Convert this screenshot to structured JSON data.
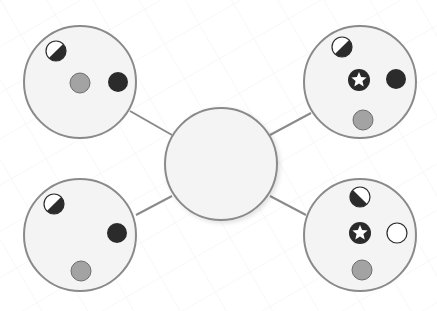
{
  "colors": {
    "background": "#ffffff",
    "grid": "#f1f1f1",
    "node_fill": "#f4f4f4",
    "node_stroke": "#8a8a8a",
    "connector": "#8a8a8a",
    "dark": "#2b2b2b",
    "gray_dot": "#a3a3a3",
    "gray_dot_stroke": "#6e6e6e",
    "white_dot": "#ffffff"
  },
  "center_node": {
    "cx": 221,
    "cy": 164,
    "r": 56
  },
  "nodes": [
    {
      "id": "top-left",
      "cx": 80,
      "cy": 82,
      "r": 56,
      "connector": {
        "x1": 130,
        "y1": 111,
        "x2": 172,
        "y2": 135
      },
      "items": [
        {
          "type": "half",
          "orientation": "dark-lower-right",
          "cx": 56,
          "cy": 51
        },
        {
          "type": "gray",
          "cx": 80,
          "cy": 83
        },
        {
          "type": "black",
          "cx": 118,
          "cy": 82
        }
      ]
    },
    {
      "id": "top-right",
      "cx": 360,
      "cy": 82,
      "r": 56,
      "connector": {
        "x1": 311,
        "y1": 113,
        "x2": 270,
        "y2": 135
      },
      "items": [
        {
          "type": "half",
          "orientation": "dark-lower-right",
          "cx": 342,
          "cy": 47
        },
        {
          "type": "star",
          "cx": 359,
          "cy": 80
        },
        {
          "type": "black",
          "cx": 396,
          "cy": 79
        },
        {
          "type": "gray",
          "cx": 363,
          "cy": 120
        }
      ]
    },
    {
      "id": "bottom-left",
      "cx": 80,
      "cy": 235,
      "r": 56,
      "connector": {
        "x1": 136,
        "y1": 215,
        "x2": 172,
        "y2": 196
      },
      "items": [
        {
          "type": "half",
          "orientation": "dark-lower-right",
          "cx": 54,
          "cy": 204
        },
        {
          "type": "black",
          "cx": 117,
          "cy": 233
        },
        {
          "type": "gray",
          "cx": 81,
          "cy": 271
        }
      ]
    },
    {
      "id": "bottom-right",
      "cx": 360,
      "cy": 235,
      "r": 56,
      "connector": {
        "x1": 306,
        "y1": 215,
        "x2": 270,
        "y2": 196
      },
      "items": [
        {
          "type": "half",
          "orientation": "dark-lower-left",
          "cx": 360,
          "cy": 197
        },
        {
          "type": "star",
          "cx": 360,
          "cy": 233
        },
        {
          "type": "white",
          "cx": 397,
          "cy": 233
        },
        {
          "type": "gray",
          "cx": 362,
          "cy": 270
        }
      ]
    }
  ],
  "dot_radius": 10
}
